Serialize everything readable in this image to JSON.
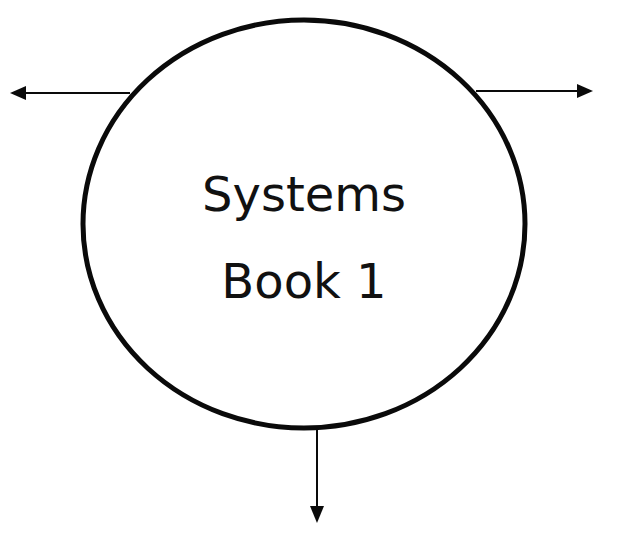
{
  "diagram": {
    "type": "system-node-with-outputs",
    "node": {
      "shape": "circle",
      "lines": [
        "Systems",
        "Book 1"
      ],
      "stroke_color": "#0a0a0a",
      "fill_color": "#ffffff"
    },
    "arrows": [
      {
        "direction": "left",
        "label": ""
      },
      {
        "direction": "right",
        "label": ""
      },
      {
        "direction": "down",
        "label": ""
      }
    ],
    "colors": {
      "background": "#ffffff",
      "ink": "#0a0a0a"
    }
  }
}
